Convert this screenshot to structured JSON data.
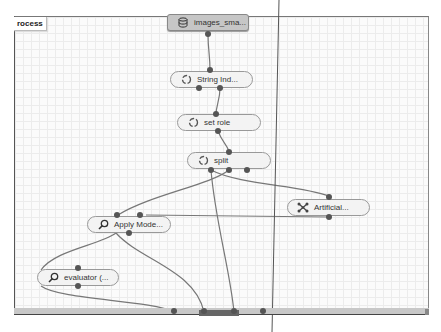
{
  "process_tab": {
    "label": "rocess"
  },
  "nodes": [
    {
      "id": "images",
      "label": "images_sma...",
      "icon": "database-icon"
    },
    {
      "id": "string_ind",
      "label": "String Ind...",
      "icon": "loop-icon"
    },
    {
      "id": "set_role",
      "label": "set role",
      "icon": "loop-icon"
    },
    {
      "id": "split",
      "label": "split",
      "icon": "loop-icon"
    },
    {
      "id": "artificial",
      "label": "Artificial...",
      "icon": "network-icon"
    },
    {
      "id": "apply_model",
      "label": "Apply Mode...",
      "icon": "search-icon"
    },
    {
      "id": "evaluator",
      "label": "evaluator (...",
      "icon": "search-icon"
    }
  ],
  "colors": {
    "wire": "#777777",
    "port": "#555555",
    "node_bg": "#f3f3f3",
    "source_node_bg": "#c6c6c6",
    "grid": "#ececec"
  }
}
